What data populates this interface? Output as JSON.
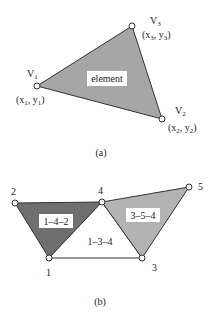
{
  "panel_a": {
    "caption": "(a)",
    "element_label": "element",
    "fill": "#a6a6a6",
    "vertices": [
      {
        "name": "V",
        "sub": "1",
        "coord_x": "x",
        "coord_y": "y",
        "coord_sub": "1"
      },
      {
        "name": "V",
        "sub": "2",
        "coord_x": "x",
        "coord_y": "y",
        "coord_sub": "2"
      },
      {
        "name": "V",
        "sub": "3",
        "coord_x": "x",
        "coord_y": "y",
        "coord_sub": "3"
      }
    ]
  },
  "panel_b": {
    "caption": "(b)",
    "nodes": [
      "1",
      "2",
      "3",
      "4",
      "5"
    ],
    "elements": [
      {
        "label": "1–4–2",
        "fill": "#6f6f6f"
      },
      {
        "label": "1–3–4",
        "fill": "#ffffff"
      },
      {
        "label": "3–5–4",
        "fill": "#b3b3b3"
      }
    ]
  }
}
